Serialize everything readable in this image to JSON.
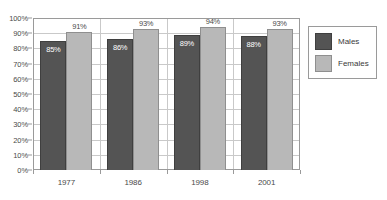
{
  "chart_data": {
    "type": "bar",
    "title": "",
    "xlabel": "",
    "ylabel": "",
    "ylim": [
      0,
      100
    ],
    "grid": true,
    "legend_position": "right",
    "categories": [
      "1977",
      "1986",
      "1998",
      "2001"
    ],
    "ytick_labels": [
      "100%",
      "90%",
      "80%",
      "70%",
      "60%",
      "50%",
      "40%",
      "30%",
      "20%",
      "10%",
      "0%"
    ],
    "ytick_values": [
      100,
      90,
      80,
      70,
      60,
      50,
      40,
      30,
      20,
      10,
      0
    ],
    "series": [
      {
        "name": "Males",
        "color": "#545454",
        "values": [
          85,
          86,
          89,
          88
        ],
        "labels": [
          "85%",
          "86%",
          "89%",
          "88%"
        ]
      },
      {
        "name": "Females",
        "color": "#b8b8b8",
        "values": [
          91,
          93,
          94,
          93
        ],
        "labels": [
          "91%",
          "93%",
          "94%",
          "93%"
        ]
      }
    ]
  },
  "legend": {
    "items": [
      {
        "label": "Males",
        "color": "#545454"
      },
      {
        "label": "Females",
        "color": "#b8b8b8"
      }
    ]
  },
  "title_sliver": ""
}
